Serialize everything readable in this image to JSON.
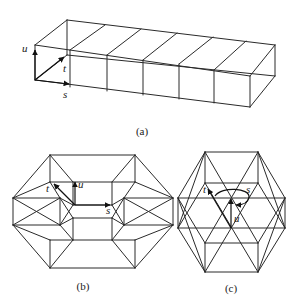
{
  "figure": {
    "panel_a": {
      "caption": "(a)",
      "axis_labels": {
        "u": "u",
        "t": "t",
        "s": "s"
      },
      "edges": [
        [
          35,
          45,
          67,
          20
        ],
        [
          67,
          20,
          275,
          45
        ],
        [
          35,
          45,
          250,
          76
        ],
        [
          250,
          76,
          275,
          45
        ],
        [
          35,
          45,
          35,
          80
        ],
        [
          35,
          80,
          250,
          107
        ],
        [
          250,
          76,
          250,
          107
        ],
        [
          250,
          107,
          275,
          76
        ],
        [
          275,
          45,
          275,
          76
        ],
        [
          67,
          20,
          67,
          55
        ],
        [
          35,
          80,
          67,
          55
        ],
        [
          67,
          55,
          275,
          76
        ],
        [
          70,
          50,
          105,
          25
        ],
        [
          70,
          50,
          70,
          87
        ],
        [
          107,
          55,
          141,
          29
        ],
        [
          107,
          55,
          107,
          91
        ],
        [
          143,
          60,
          177,
          33
        ],
        [
          143,
          60,
          143,
          95
        ],
        [
          179,
          64,
          213,
          37
        ],
        [
          179,
          64,
          179,
          99
        ],
        [
          214,
          70,
          246,
          41
        ],
        [
          214,
          70,
          214,
          103
        ]
      ],
      "axes": [
        {
          "name": "u",
          "x1": 35,
          "y1": 80,
          "x2": 35,
          "y2": 50
        },
        {
          "name": "t",
          "x1": 35,
          "y1": 80,
          "x2": 64,
          "y2": 57
        },
        {
          "name": "s",
          "x1": 35,
          "y1": 80,
          "x2": 69,
          "y2": 84
        }
      ],
      "label_pos": {
        "u": [
          22,
          52
        ],
        "t": [
          63,
          72
        ],
        "s": [
          63,
          98
        ],
        "caption": [
          142,
          135
        ]
      }
    },
    "panel_b": {
      "caption": "(b)",
      "axis_labels": {
        "u": "u",
        "t": "t",
        "s": "s"
      },
      "edges": [
        [
          50,
          155,
          135,
          155
        ],
        [
          50,
          155,
          13,
          198
        ],
        [
          13,
          198,
          13,
          225
        ],
        [
          13,
          225,
          50,
          268
        ],
        [
          50,
          268,
          135,
          268
        ],
        [
          135,
          268,
          173,
          225
        ],
        [
          173,
          225,
          173,
          198
        ],
        [
          173,
          198,
          135,
          155
        ],
        [
          50,
          155,
          50,
          182
        ],
        [
          135,
          155,
          135,
          182
        ],
        [
          50,
          182,
          135,
          182
        ],
        [
          13,
          198,
          50,
          182
        ],
        [
          173,
          198,
          135,
          182
        ],
        [
          50,
          182,
          60,
          198
        ],
        [
          135,
          182,
          124,
          198
        ],
        [
          13,
          198,
          60,
          198
        ],
        [
          173,
          198,
          124,
          198
        ],
        [
          13,
          225,
          60,
          225
        ],
        [
          173,
          225,
          124,
          225
        ],
        [
          60,
          198,
          60,
          225
        ],
        [
          124,
          198,
          124,
          225
        ],
        [
          50,
          240,
          135,
          240
        ],
        [
          50,
          240,
          50,
          268
        ],
        [
          135,
          240,
          135,
          268
        ],
        [
          13,
          225,
          50,
          240
        ],
        [
          173,
          225,
          135,
          240
        ],
        [
          60,
          225,
          73,
          240
        ],
        [
          124,
          225,
          112,
          240
        ],
        [
          73,
          218,
          112,
          218
        ],
        [
          73,
          218,
          73,
          240
        ],
        [
          112,
          218,
          112,
          240
        ],
        [
          73,
          205,
          112,
          205
        ],
        [
          73,
          182,
          73,
          205
        ],
        [
          112,
          182,
          112,
          205
        ],
        [
          60,
          198,
          73,
          205
        ],
        [
          124,
          198,
          112,
          205
        ],
        [
          60,
          225,
          73,
          218
        ],
        [
          124,
          225,
          112,
          218
        ],
        [
          73,
          205,
          60,
          225
        ],
        [
          112,
          205,
          124,
          225
        ],
        [
          73,
          218,
          60,
          198
        ],
        [
          112,
          218,
          124,
          198
        ],
        [
          50,
          155,
          73,
          182
        ],
        [
          135,
          155,
          112,
          182
        ],
        [
          50,
          268,
          73,
          240
        ],
        [
          135,
          268,
          112,
          240
        ],
        [
          13,
          198,
          60,
          225
        ],
        [
          13,
          225,
          60,
          198
        ],
        [
          173,
          198,
          124,
          225
        ],
        [
          173,
          225,
          124,
          198
        ]
      ],
      "axes": [
        {
          "name": "u",
          "x1": 75,
          "y1": 205,
          "x2": 75,
          "y2": 182
        },
        {
          "name": "t",
          "x1": 75,
          "y1": 205,
          "x2": 54,
          "y2": 184
        },
        {
          "name": "s",
          "x1": 75,
          "y1": 205,
          "x2": 110,
          "y2": 205
        }
      ],
      "label_pos": {
        "u": [
          78,
          188
        ],
        "t": [
          46,
          192
        ],
        "s": [
          106,
          214
        ],
        "caption": [
          83,
          290
        ]
      }
    },
    "panel_c": {
      "caption": "(c)",
      "axis_labels": {
        "u": "u",
        "t": "t",
        "s": "s"
      },
      "edges": [
        [
          205,
          152,
          258,
          152
        ],
        [
          205,
          152,
          178,
          198
        ],
        [
          178,
          198,
          178,
          228
        ],
        [
          178,
          228,
          205,
          272
        ],
        [
          205,
          272,
          258,
          272
        ],
        [
          258,
          272,
          285,
          228
        ],
        [
          285,
          228,
          285,
          198
        ],
        [
          285,
          198,
          258,
          152
        ],
        [
          205,
          152,
          205,
          183
        ],
        [
          258,
          152,
          258,
          183
        ],
        [
          205,
          183,
          258,
          183
        ],
        [
          178,
          198,
          285,
          198
        ],
        [
          178,
          228,
          285,
          228
        ],
        [
          205,
          243,
          258,
          243
        ],
        [
          205,
          243,
          205,
          272
        ],
        [
          258,
          243,
          258,
          272
        ],
        [
          205,
          152,
          258,
          243
        ],
        [
          258,
          152,
          205,
          243
        ],
        [
          205,
          183,
          258,
          272
        ],
        [
          258,
          183,
          205,
          272
        ],
        [
          178,
          198,
          205,
          243
        ],
        [
          285,
          198,
          258,
          243
        ],
        [
          178,
          228,
          205,
          183
        ],
        [
          285,
          228,
          258,
          183
        ],
        [
          205,
          152,
          178,
          228
        ],
        [
          258,
          152,
          285,
          228
        ],
        [
          205,
          272,
          178,
          198
        ],
        [
          258,
          272,
          285,
          198
        ]
      ],
      "axes": [
        {
          "name": "u",
          "x1": 231,
          "y1": 228,
          "x2": 231,
          "y2": 199
        },
        {
          "name": "t",
          "x1": 231,
          "y1": 228,
          "x2": 208,
          "y2": 189
        }
      ],
      "s_arc": {
        "d": "M 215 196 C 222 186, 250 188, 249 197 C 248 204, 240 205, 236 205"
      },
      "label_pos": {
        "u": [
          234,
          222
        ],
        "t": [
          203,
          193
        ],
        "s": [
          246,
          193
        ],
        "caption": [
          231,
          292
        ]
      }
    }
  }
}
